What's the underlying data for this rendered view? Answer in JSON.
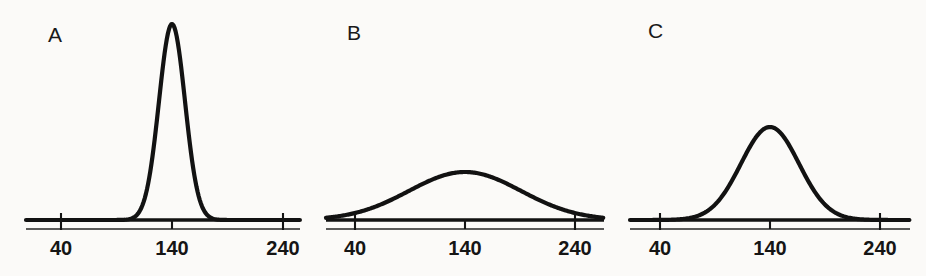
{
  "figure": {
    "background_color": "#fbfaf8",
    "ink_color": "#121212",
    "width": 926,
    "height": 276
  },
  "panels": [
    {
      "label": "A",
      "label_x": 48,
      "label_y": 24,
      "origin_x": 26,
      "axis_left": 26,
      "axis_right": 300,
      "baseline_y": 220,
      "axis_y": 229,
      "tick_positions": [
        61,
        172,
        283
      ],
      "tick_top": 213,
      "tick_bottom": 230,
      "ticks": [
        "40",
        "140",
        "240"
      ],
      "tick_label_y": 238,
      "peak_x": 172,
      "peak_y": 24,
      "sigma_px": 13,
      "description": "tall narrow peak"
    },
    {
      "label": "B",
      "label_x": 347,
      "label_y": 22,
      "origin_x": 326,
      "axis_left": 326,
      "axis_right": 604,
      "baseline_y": 220,
      "axis_y": 229,
      "tick_positions": [
        355,
        465,
        575
      ],
      "tick_top": 213,
      "tick_bottom": 230,
      "ticks": [
        "40",
        "140",
        "240"
      ],
      "tick_label_y": 238,
      "peak_x": 465,
      "peak_y": 172,
      "sigma_px": 56,
      "description": "low broad peak"
    },
    {
      "label": "C",
      "label_x": 648,
      "label_y": 20,
      "origin_x": 630,
      "axis_left": 630,
      "axis_right": 910,
      "baseline_y": 220,
      "axis_y": 229,
      "tick_positions": [
        660,
        770,
        880
      ],
      "tick_top": 213,
      "tick_bottom": 230,
      "ticks": [
        "40",
        "140",
        "240"
      ],
      "tick_label_y": 238,
      "peak_x": 770,
      "peak_y": 127,
      "sigma_px": 29,
      "description": "medium height and width peak"
    }
  ],
  "chart_data": {
    "type": "line",
    "title": "",
    "xlabel": "",
    "ylabel": "",
    "xlim": [
      40,
      240
    ],
    "xticks": [
      40,
      140,
      240
    ],
    "xticklabels": [
      "40",
      "140",
      "240"
    ],
    "grid": false,
    "legend": "none",
    "annotations": [
      "A",
      "B",
      "C"
    ],
    "series": [
      {
        "name": "A",
        "panel": "A",
        "distribution": "normal",
        "mean": 140,
        "sigma": 12,
        "peak_relative_height": 1.0,
        "x": [
          40,
          60,
          80,
          100,
          110,
          120,
          125,
          130,
          135,
          140,
          145,
          150,
          155,
          160,
          170,
          180,
          200,
          220,
          240
        ],
        "y": [
          0.0,
          0.0,
          0.0,
          0.0,
          0.01,
          0.05,
          0.11,
          0.25,
          0.65,
          1.0,
          0.65,
          0.25,
          0.11,
          0.05,
          0.01,
          0.0,
          0.0,
          0.0,
          0.0
        ]
      },
      {
        "name": "B",
        "panel": "B",
        "distribution": "normal",
        "mean": 140,
        "sigma": 51,
        "peak_relative_height": 0.22,
        "x": [
          40,
          60,
          80,
          100,
          110,
          120,
          130,
          140,
          150,
          160,
          170,
          180,
          200,
          220,
          240
        ],
        "y": [
          0.03,
          0.07,
          0.11,
          0.16,
          0.18,
          0.2,
          0.215,
          0.22,
          0.215,
          0.2,
          0.18,
          0.16,
          0.11,
          0.07,
          0.03
        ]
      },
      {
        "name": "C",
        "panel": "C",
        "distribution": "normal",
        "mean": 140,
        "sigma": 26,
        "peak_relative_height": 0.47,
        "x": [
          40,
          60,
          80,
          100,
          110,
          120,
          130,
          140,
          150,
          160,
          170,
          180,
          200,
          220,
          240
        ],
        "y": [
          0.0,
          0.01,
          0.04,
          0.14,
          0.22,
          0.32,
          0.43,
          0.47,
          0.43,
          0.32,
          0.22,
          0.14,
          0.04,
          0.01,
          0.0
        ]
      }
    ]
  }
}
